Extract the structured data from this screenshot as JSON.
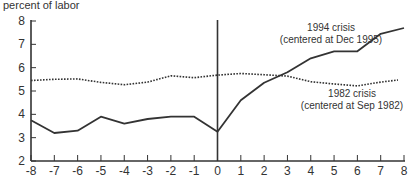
{
  "chart_data": {
    "type": "line",
    "title": "",
    "ylabel": "percent of labor",
    "ylabel_cut_line": "",
    "xlabel": "",
    "x": [
      -8,
      -7,
      -6,
      -5,
      -4,
      -3,
      -2,
      -1,
      0,
      1,
      2,
      3,
      4,
      5,
      6,
      7,
      8
    ],
    "xlim": [
      -8,
      8
    ],
    "ylim": [
      2,
      8
    ],
    "x_ticks": [
      "-8",
      "-7",
      "-6",
      "-5",
      "-4",
      "-3",
      "-2",
      "-1",
      "0",
      "1",
      "2",
      "3",
      "4",
      "5",
      "6",
      "7",
      "8"
    ],
    "y_ticks": [
      "2",
      "3",
      "4",
      "5",
      "6",
      "7",
      "8"
    ],
    "grid": false,
    "vertical_reference_line_at_x": 0,
    "series": [
      {
        "name": "1994 crisis (centered at Dec 1995)",
        "style": "solid",
        "color": "#333333",
        "values": [
          3.75,
          3.2,
          3.3,
          3.9,
          3.6,
          3.8,
          3.9,
          3.9,
          3.25,
          4.6,
          5.35,
          5.8,
          6.4,
          6.7,
          6.7,
          7.45,
          7.7
        ]
      },
      {
        "name": "1982 crisis (centered at Sep 1982)",
        "style": "dotted",
        "color": "#333333",
        "values": [
          5.45,
          5.5,
          5.52,
          5.37,
          5.27,
          5.38,
          5.65,
          5.57,
          5.68,
          5.75,
          5.7,
          5.64,
          5.4,
          5.3,
          5.22,
          5.38,
          5.47
        ]
      }
    ],
    "annotations": [
      {
        "lines": [
          "1994 crisis",
          "(centered at Dec 1995)"
        ],
        "x_px": 331,
        "y_px": 31
      },
      {
        "lines": [
          "1982 crisis",
          "(centered at Sep 1982)"
        ],
        "x_px": 352,
        "y_px": 97
      }
    ],
    "legend": "inline annotations"
  }
}
